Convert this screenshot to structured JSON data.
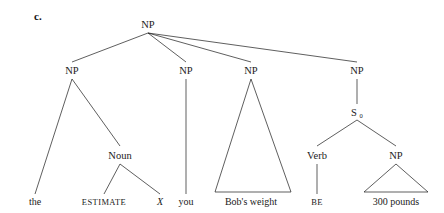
{
  "figure": {
    "item_letter": "c.",
    "type": "syntax-tree"
  },
  "nodes": {
    "root_np": {
      "label": "NP",
      "x": 148,
      "y": 24
    },
    "np1": {
      "label": "NP",
      "x": 72,
      "y": 70
    },
    "np2": {
      "label": "NP",
      "x": 186,
      "y": 70
    },
    "np3": {
      "label": "NP",
      "x": 251,
      "y": 70
    },
    "np4": {
      "label": "NP",
      "x": 357,
      "y": 70
    },
    "noun": {
      "label": "Noun",
      "x": 120,
      "y": 155
    },
    "s0": {
      "label": "S",
      "subscript": "0",
      "x": 357,
      "y": 112
    },
    "verb": {
      "label": "Verb",
      "x": 317,
      "y": 155
    },
    "np5": {
      "label": "NP",
      "x": 396,
      "y": 155
    }
  },
  "terminals": {
    "the": {
      "label": "the",
      "x": 35,
      "y": 202,
      "style": "roman"
    },
    "estimate": {
      "label": "ESTIMATE",
      "x": 104,
      "y": 202,
      "style": "smallcaps"
    },
    "x": {
      "label": "X",
      "x": 160,
      "y": 202,
      "style": "italic"
    },
    "you": {
      "label": "you",
      "x": 186,
      "y": 202,
      "style": "roman"
    },
    "bobs_weight": {
      "label": "Bob's weight",
      "x": 251,
      "y": 202,
      "style": "roman"
    },
    "be": {
      "label": "BE",
      "x": 317,
      "y": 202,
      "style": "smallcaps"
    },
    "three_hundred_pounds": {
      "label": "300 pounds",
      "x": 396,
      "y": 202,
      "style": "roman"
    }
  },
  "colors": {
    "line": "#1a1a1a",
    "text": "#1a1a1a",
    "background": "#ffffff"
  }
}
